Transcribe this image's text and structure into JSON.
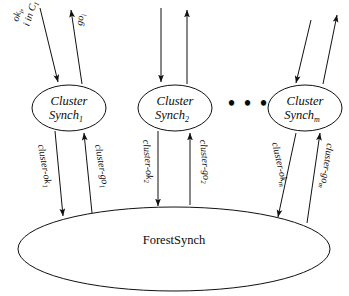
{
  "diagram": {
    "title_text_present": false,
    "colors": {
      "stroke": "#111111",
      "fill": "#ffffff",
      "text": "#0a0a0a"
    },
    "external_labels": {
      "ok_label_line1": "ok",
      "ok_label_sub1": "i",
      "ok_label_line2": ",",
      "ok_label_line3": "i in C",
      "ok_label_sub3": "1",
      "go_label": "go",
      "go_label_sub": "i"
    },
    "clusters": [
      {
        "name": "cluster-synch-1",
        "line1": "Cluster",
        "line2": "Synch",
        "subscript": "1",
        "in_edge_label_main": "cluster-ok",
        "in_edge_label_sub": "1",
        "out_edge_label_main": "cluster-go",
        "out_edge_label_sub": "1"
      },
      {
        "name": "cluster-synch-2",
        "line1": "Cluster",
        "line2": "Synch",
        "subscript": "2",
        "in_edge_label_main": "cluster-ok",
        "in_edge_label_sub": "2",
        "out_edge_label_main": "cluster-go",
        "out_edge_label_sub": "2"
      },
      {
        "name": "cluster-synch-m",
        "line1": "Cluster",
        "line2": "Synch",
        "subscript": "m",
        "in_edge_label_main": "cluster-ok",
        "in_edge_label_sub": "m",
        "out_edge_label_main": "cluster-go",
        "out_edge_label_sub": "m"
      }
    ],
    "ellipsis": "• • •",
    "forest": {
      "name": "forest-synch",
      "label": "ForestSynch"
    }
  }
}
